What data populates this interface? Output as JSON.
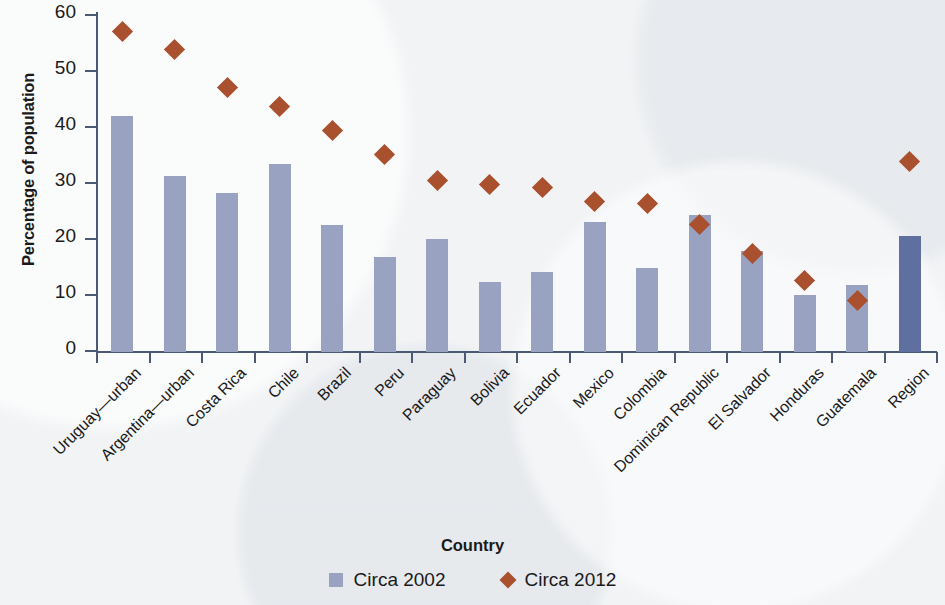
{
  "chart_data": {
    "type": "bar",
    "title": "",
    "xlabel": "Country",
    "ylabel": "Percentage of population",
    "ylim": [
      0,
      60
    ],
    "yticks": [
      0,
      10,
      20,
      30,
      40,
      50,
      60
    ],
    "grid": false,
    "legend_position": "bottom",
    "categories": [
      "Uruguay—urban",
      "Argentina—urban",
      "Costa Rica",
      "Chile",
      "Brazil",
      "Peru",
      "Paraguay",
      "Bolivia",
      "Ecuador",
      "Mexico",
      "Colombia",
      "Dominican Republic",
      "El Salvador",
      "Honduras",
      "Guatemala",
      "Region"
    ],
    "series": [
      {
        "name": "Circa 2002",
        "marker": "square",
        "color": "#9aa2c2",
        "accent_color": "#5f6fa0",
        "accent_index": 15,
        "values": [
          42.1,
          31.4,
          28.4,
          33.5,
          22.6,
          16.9,
          20.2,
          12.5,
          14.2,
          23.2,
          15.0,
          24.4,
          18.0,
          10.1,
          11.9,
          20.7
        ]
      },
      {
        "name": "Circa 2012",
        "marker": "diamond",
        "color": "#a9502f",
        "values": [
          57.2,
          54.0,
          47.2,
          43.9,
          39.5,
          35.2,
          30.6,
          30.0,
          29.3,
          26.9,
          26.6,
          22.7,
          17.6,
          12.7,
          9.2,
          34.1
        ]
      }
    ]
  },
  "legend": {
    "items": [
      {
        "label": "Circa 2002",
        "swatch": "square-swatch-icon"
      },
      {
        "label": "Circa 2012",
        "swatch": "diamond-swatch-icon"
      }
    ]
  }
}
